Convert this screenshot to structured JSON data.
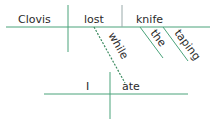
{
  "diagram": {
    "type": "sentence-diagram",
    "line_color": "#4aa37a",
    "main_clause": {
      "subject": "Clovis",
      "verb": "lost",
      "object": "knife",
      "object_modifiers": [
        "the",
        "taping"
      ]
    },
    "connector": "while",
    "sub_clause": {
      "subject": "I",
      "verb": "ate"
    }
  }
}
